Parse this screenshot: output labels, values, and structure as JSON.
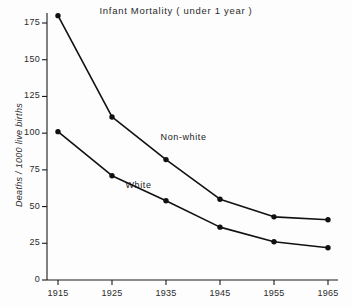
{
  "chart_data": {
    "type": "line",
    "title": "Infant  Mortality  ( under 1 year )",
    "xlabel": "",
    "ylabel": "Deaths / 1000 live births",
    "x": [
      1915,
      1925,
      1935,
      1945,
      1955,
      1965
    ],
    "categories": [
      "1915",
      "1925",
      "1935",
      "1945",
      "1955",
      "1965"
    ],
    "xlim": [
      1915,
      1965
    ],
    "ylim": [
      0,
      182
    ],
    "y_ticks": [
      0,
      25,
      50,
      75,
      100,
      125,
      150,
      175
    ],
    "y_tick_labels": [
      "0",
      "25",
      "50",
      "75",
      "100",
      "125",
      "150",
      "175"
    ],
    "x_ticks": [
      1915,
      1925,
      1935,
      1945,
      1955,
      1965
    ],
    "x_tick_labels": [
      "1915",
      "1925",
      "1935",
      "1945",
      "1955",
      "1965"
    ],
    "grid": false,
    "legend_position": "inline-annotation",
    "series": [
      {
        "name": "Non-white",
        "label": "Non-white",
        "color": "#111111",
        "marker": "circle",
        "values": [
          180,
          111,
          82,
          55,
          43,
          41
        ]
      },
      {
        "name": "White",
        "label": "White",
        "color": "#111111",
        "marker": "circle",
        "values": [
          101,
          71,
          54,
          36,
          26,
          22
        ]
      }
    ],
    "annotations": [
      {
        "text": "Non-white",
        "x": 1934,
        "y": 97
      },
      {
        "text": "White",
        "x": 1927.5,
        "y": 64
      }
    ],
    "axis_color": "#1a1a1a",
    "background": "#fdfdfd"
  }
}
